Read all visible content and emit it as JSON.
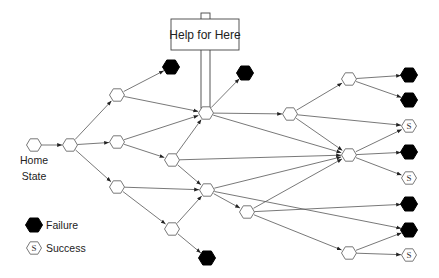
{
  "sign": {
    "label": "Help for Here",
    "box": {
      "x": 171,
      "y": 19,
      "w": 68,
      "h": 31
    },
    "post": {
      "x": 201,
      "top": 13,
      "w": 9,
      "bottom": 108
    }
  },
  "home_label": {
    "line1": "Home",
    "line2": "State"
  },
  "legend": {
    "failure_label": "Failure",
    "success_label": "Success",
    "success_glyph": "S"
  },
  "colors": {
    "stroke": "#555555",
    "failure_fill": "#000000",
    "node_fill": "#ffffff",
    "sign_stroke": "#444444"
  },
  "nodes": [
    {
      "id": "home",
      "x": 34,
      "y": 145,
      "type": "state"
    },
    {
      "id": "n1",
      "x": 70,
      "y": 145,
      "type": "state"
    },
    {
      "id": "n2a",
      "x": 117,
      "y": 95,
      "type": "state"
    },
    {
      "id": "n2b",
      "x": 117,
      "y": 142,
      "type": "state"
    },
    {
      "id": "n2c",
      "x": 117,
      "y": 187,
      "type": "state"
    },
    {
      "id": "f1",
      "x": 171,
      "y": 67,
      "type": "failure"
    },
    {
      "id": "n3",
      "x": 206,
      "y": 113,
      "type": "state"
    },
    {
      "id": "f2",
      "x": 245,
      "y": 73,
      "type": "failure"
    },
    {
      "id": "n4",
      "x": 172,
      "y": 160,
      "type": "state"
    },
    {
      "id": "n5",
      "x": 207,
      "y": 190,
      "type": "state"
    },
    {
      "id": "n6",
      "x": 172,
      "y": 229,
      "type": "state"
    },
    {
      "id": "f3",
      "x": 207,
      "y": 258,
      "type": "failure"
    },
    {
      "id": "n7",
      "x": 290,
      "y": 114,
      "type": "state"
    },
    {
      "id": "n8",
      "x": 247,
      "y": 212,
      "type": "state"
    },
    {
      "id": "n9",
      "x": 349,
      "y": 79,
      "type": "state"
    },
    {
      "id": "n10",
      "x": 349,
      "y": 155,
      "type": "state"
    },
    {
      "id": "n11",
      "x": 349,
      "y": 253,
      "type": "state"
    },
    {
      "id": "r1",
      "x": 409,
      "y": 75,
      "type": "failure"
    },
    {
      "id": "r2",
      "x": 409,
      "y": 100,
      "type": "failure"
    },
    {
      "id": "r3",
      "x": 409,
      "y": 126,
      "type": "success"
    },
    {
      "id": "r4",
      "x": 409,
      "y": 152,
      "type": "failure"
    },
    {
      "id": "r5",
      "x": 409,
      "y": 178,
      "type": "success"
    },
    {
      "id": "r6",
      "x": 409,
      "y": 204,
      "type": "failure"
    },
    {
      "id": "r7",
      "x": 409,
      "y": 230,
      "type": "failure"
    },
    {
      "id": "r8",
      "x": 409,
      "y": 255,
      "type": "success"
    }
  ],
  "edges": [
    [
      "home",
      "n1"
    ],
    [
      "n1",
      "n2a"
    ],
    [
      "n1",
      "n2b"
    ],
    [
      "n1",
      "n2c"
    ],
    [
      "n2a",
      "f1"
    ],
    [
      "n2a",
      "n3"
    ],
    [
      "n2b",
      "n3"
    ],
    [
      "n2b",
      "n4"
    ],
    [
      "n2c",
      "n5"
    ],
    [
      "n2c",
      "n6"
    ],
    [
      "n4",
      "n3"
    ],
    [
      "n4",
      "n5"
    ],
    [
      "n4",
      "n10"
    ],
    [
      "n6",
      "n5"
    ],
    [
      "n6",
      "f3"
    ],
    [
      "n3",
      "f2"
    ],
    [
      "n3",
      "n7"
    ],
    [
      "n3",
      "n10"
    ],
    [
      "n5",
      "n10"
    ],
    [
      "n5",
      "n8"
    ],
    [
      "n5",
      "r7"
    ],
    [
      "n7",
      "n9"
    ],
    [
      "n7",
      "r3"
    ],
    [
      "n7",
      "n10"
    ],
    [
      "n9",
      "r1"
    ],
    [
      "n9",
      "r2"
    ],
    [
      "n10",
      "r3"
    ],
    [
      "n10",
      "r4"
    ],
    [
      "n10",
      "r5"
    ],
    [
      "n8",
      "n10"
    ],
    [
      "n8",
      "r6"
    ],
    [
      "n8",
      "n11"
    ],
    [
      "n11",
      "r7"
    ],
    [
      "n11",
      "r8"
    ]
  ]
}
